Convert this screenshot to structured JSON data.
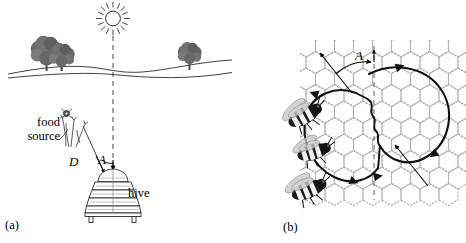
{
  "figure": {
    "background_color": "#ffffff",
    "ink_color": "#000000",
    "comb_color": "#b9b9b9",
    "width": 466,
    "height": 243
  },
  "panels": [
    {
      "id": "a",
      "label": "(a)",
      "caption_scene": "field landscape with sun, trees, flowers and hive",
      "labels": {
        "food_source": "food\nsource",
        "hive": "hive",
        "distance": "D",
        "angle": "A"
      },
      "elements": {
        "sun": "sun-icon",
        "sun_line": "dashed-sun-bearing-line",
        "trees_left": 2,
        "trees_right": 1,
        "horizon": "rolling-ground-line",
        "flowers": "flower-cluster-icon",
        "hive": "skep-hive-icon"
      },
      "annotations": {
        "D_meaning": "distance from hive to food source",
        "A_meaning": "angle between the sun bearing and the food source bearing"
      }
    },
    {
      "id": "b",
      "label": "(b)",
      "caption_scene": "bees performing the waggle dance on vertical honeycomb",
      "labels": {
        "angle": "A"
      },
      "elements": {
        "comb": "honeycomb-grid",
        "dance_path": "figure-eight-waggle-dance-path",
        "vertical_reference": "dashed-vertical-gravity-line",
        "waggle_run_axis": "diagonal-waggle-run-arrow",
        "bees": 3
      },
      "annotations": {
        "A_meaning": "angle of the waggle run from vertical equals the angle of the food source from the sun"
      }
    }
  ]
}
